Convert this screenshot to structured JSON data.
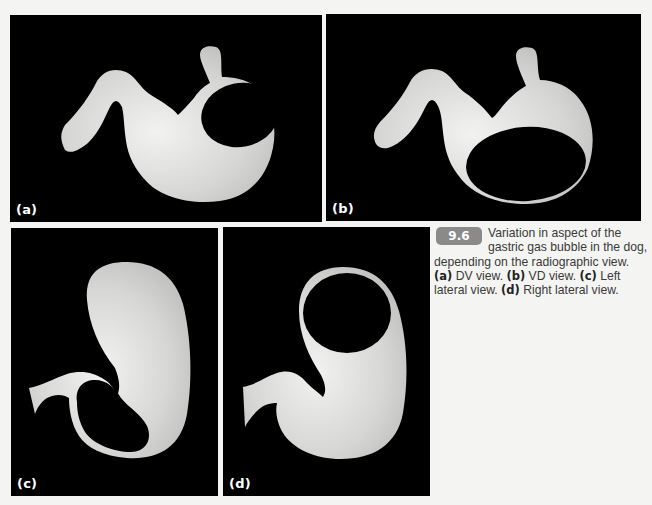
{
  "figure": {
    "number": "9.6",
    "caption_intro": "Variation in aspect of the gastric gas bubble in the dog, depending on the radiographic view.",
    "caption_items": [
      {
        "label": "(a)",
        "text": " DV view. "
      },
      {
        "label": "(b)",
        "text": " VD view. "
      },
      {
        "label": "(c)",
        "text": " Left lateral view. "
      },
      {
        "label": "(d)",
        "text": " Right lateral view."
      }
    ],
    "colors": {
      "panel_background": "#000000",
      "organ_fill": "#d9d9d7",
      "gas_bubble": "#000000",
      "badge": "#8a8a8a",
      "page": "#f4f4f2"
    }
  },
  "panels": [
    {
      "id": "a",
      "label": "(a)",
      "view": "DV view"
    },
    {
      "id": "b",
      "label": "(b)",
      "view": "VD view"
    },
    {
      "id": "c",
      "label": "(c)",
      "view": "Left lateral view"
    },
    {
      "id": "d",
      "label": "(d)",
      "view": "Right lateral view"
    }
  ]
}
